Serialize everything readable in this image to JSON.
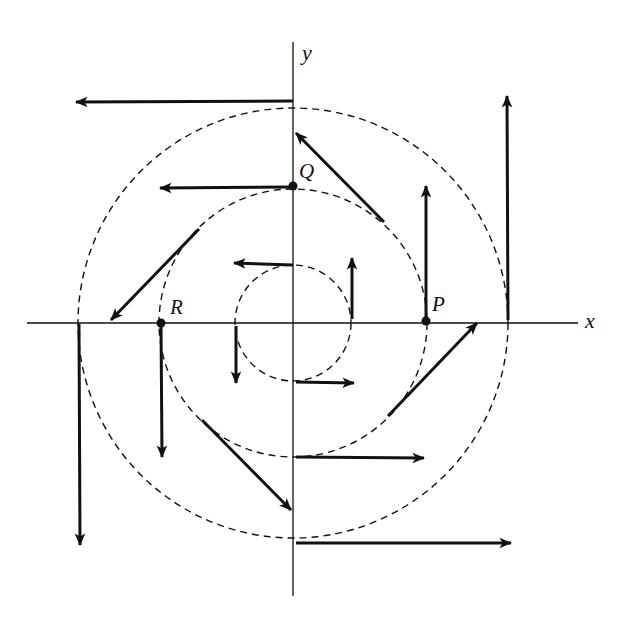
{
  "diagram": {
    "title": "",
    "colors": {
      "ink": "#111111",
      "background": "#ffffff"
    },
    "origin": {
      "x": 293,
      "y": 323
    },
    "axes": {
      "x": {
        "label": "x",
        "from": 27,
        "to": 578,
        "label_pos": [
          585,
          328
        ]
      },
      "y": {
        "label": "y",
        "from": 42,
        "to": 596,
        "label_pos": [
          302,
          60
        ]
      }
    },
    "circles": [
      {
        "name": "inner",
        "r": 58,
        "style": "dashed"
      },
      {
        "name": "middle",
        "r": 134,
        "style": "dashed"
      },
      {
        "name": "outer",
        "r": 215,
        "style": "dashed"
      }
    ],
    "points": [
      {
        "label": "P",
        "x": 426,
        "y": 321,
        "label_pos": [
          432,
          311
        ]
      },
      {
        "label": "Q",
        "x": 293,
        "y": 186,
        "label_pos": [
          299,
          178
        ]
      },
      {
        "label": "R",
        "x": 161,
        "y": 323,
        "label_pos": [
          170,
          314
        ]
      }
    ],
    "vectors": [
      {
        "circle": "inner",
        "from": [
          293,
          265
        ],
        "to": [
          234,
          263
        ]
      },
      {
        "circle": "inner",
        "from": [
          236,
          326
        ],
        "to": [
          236,
          383
        ]
      },
      {
        "circle": "inner",
        "from": [
          296,
          382
        ],
        "to": [
          354,
          383
        ]
      },
      {
        "circle": "inner",
        "from": [
          352,
          319
        ],
        "to": [
          352,
          258
        ]
      },
      {
        "circle": "middle",
        "from": [
          293,
          187
        ],
        "to": [
          160,
          188
        ]
      },
      {
        "circle": "middle",
        "from": [
          199,
          229
        ],
        "to": [
          111,
          320
        ]
      },
      {
        "circle": "middle",
        "from": [
          161,
          324
        ],
        "to": [
          162,
          457
        ]
      },
      {
        "circle": "middle",
        "from": [
          202,
          420
        ],
        "to": [
          291,
          510
        ]
      },
      {
        "circle": "middle",
        "from": [
          296,
          457
        ],
        "to": [
          424,
          458
        ]
      },
      {
        "circle": "middle",
        "from": [
          388,
          416
        ],
        "to": [
          477,
          323
        ]
      },
      {
        "circle": "middle",
        "from": [
          426,
          320
        ],
        "to": [
          426,
          186
        ]
      },
      {
        "circle": "middle",
        "from": [
          384,
          222
        ],
        "to": [
          296,
          133
        ]
      },
      {
        "circle": "outer",
        "from": [
          293,
          101
        ],
        "to": [
          76,
          102
        ]
      },
      {
        "circle": "outer",
        "from": [
          79,
          324
        ],
        "to": [
          80,
          545
        ]
      },
      {
        "circle": "outer",
        "from": [
          296,
          543
        ],
        "to": [
          511,
          543
        ]
      },
      {
        "circle": "outer",
        "from": [
          508,
          320
        ],
        "to": [
          507,
          96
        ]
      }
    ]
  }
}
